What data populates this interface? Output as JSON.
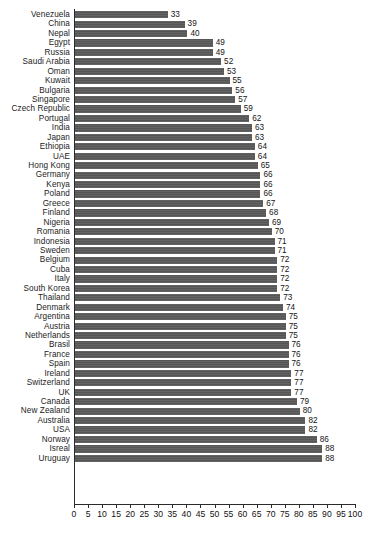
{
  "chart_data": {
    "type": "bar",
    "orientation": "horizontal",
    "title": "",
    "subtitle": "",
    "xlabel": "",
    "ylabel": "",
    "xlim": [
      0,
      100
    ],
    "xticks": [
      0,
      5,
      10,
      15,
      20,
      25,
      30,
      35,
      40,
      45,
      50,
      55,
      60,
      65,
      70,
      75,
      80,
      85,
      90,
      95,
      100
    ],
    "grid": false,
    "legend": false,
    "bar_color": "#5a5a5a",
    "background_color": "#ffffff",
    "axis_color": "#2b2b2b",
    "data_labels": true,
    "categories": [
      "Venezuela",
      "China",
      "Nepal",
      "Egypt",
      "Russia",
      "Saudi Arabia",
      "Oman",
      "Kuwait",
      "Bulgaria",
      "Singapore",
      "Czech Republic",
      "Portugal",
      "India",
      "Japan",
      "Ethiopia",
      "UAE",
      "Hong Kong",
      "Germany",
      "Kenya",
      "Poland",
      "Greece",
      "Finland",
      "Nigeria",
      "Romania",
      "Indonesia",
      "Sweden",
      "Belgium",
      "Cuba",
      "Italy",
      "South Korea",
      "Thailand",
      "Denmark",
      "Argentina",
      "Austria",
      "Netherlands",
      "Brasil",
      "France",
      "Spain",
      "Ireland",
      "Switzerland",
      "UK",
      "Canada",
      "New Zealand",
      "Australia",
      "USA",
      "Norway",
      "Isreal",
      "Uruguay"
    ],
    "values": [
      33,
      39,
      40,
      49,
      49,
      52,
      53,
      55,
      56,
      57,
      59,
      62,
      63,
      63,
      64,
      64,
      65,
      66,
      66,
      66,
      67,
      68,
      69,
      70,
      71,
      71,
      72,
      72,
      72,
      72,
      73,
      74,
      75,
      75,
      75,
      76,
      76,
      76,
      77,
      77,
      77,
      79,
      80,
      82,
      82,
      86,
      88,
      88
    ]
  }
}
